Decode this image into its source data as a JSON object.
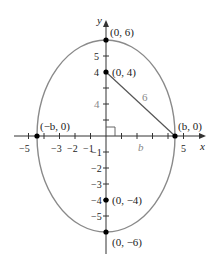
{
  "diagram": {
    "axes": {
      "x_label": "x",
      "y_label": "y"
    },
    "x_ticks": [
      "−5",
      "−3",
      "−2",
      "−1",
      "5"
    ],
    "y_ticks": [
      "5",
      "4",
      "−1",
      "−2",
      "−3",
      "−4",
      "−5"
    ],
    "points": [
      {
        "label": "(0, 6)"
      },
      {
        "label": "(0, 4)"
      },
      {
        "label": "(−b, 0)"
      },
      {
        "label": "(b, 0)"
      },
      {
        "label": "(0, −4)"
      },
      {
        "label": "(0, −6)"
      }
    ],
    "segment_label": "6",
    "vertical_leg_label": "4",
    "horizontal_leg_label": "b",
    "colors": {
      "ellipse": "#8a8a8a",
      "axes": "#333333",
      "points": "#000000",
      "segment": "#555555"
    }
  }
}
